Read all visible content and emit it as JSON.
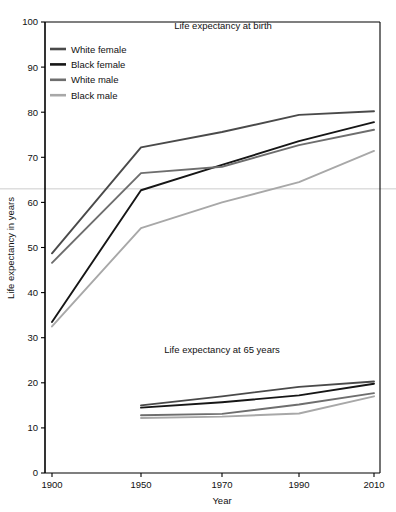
{
  "figure": {
    "background": "#ffffff",
    "frame_color": "#000000"
  },
  "axes": {
    "xlabel": "Year",
    "ylabel": "Life expectancy in years",
    "x_ticks": [
      "1900",
      "1950",
      "1970",
      "1990",
      "2010"
    ],
    "y_ticks": [
      "0",
      "10",
      "20",
      "30",
      "40",
      "50",
      "60",
      "70",
      "80",
      "90",
      "100"
    ],
    "xlim": [
      1900,
      2010
    ],
    "ylim": [
      0,
      100
    ],
    "grid": false,
    "reference_line_value": 63,
    "reference_line_color": "#cccccc"
  },
  "panel_titles": {
    "upper": "Life expectancy at birth",
    "lower": "Life expectancy at 65 years"
  },
  "legend": {
    "position": "top-left",
    "entries": [
      {
        "label": "White female",
        "color": "#4a4a4a"
      },
      {
        "label": "Black female",
        "color": "#161616"
      },
      {
        "label": "White male",
        "color": "#6e6e6e"
      },
      {
        "label": "Black male",
        "color": "#a8a8a8"
      }
    ]
  },
  "chart_data": {
    "type": "line",
    "title": "Life expectancy at birth",
    "subtitle": "Life expectancy at 65 years",
    "xlabel": "Year",
    "ylabel": "Life expectancy in years",
    "xlim": [
      1900,
      2010
    ],
    "ylim": [
      0,
      100
    ],
    "grid": false,
    "legend_position": "top-left",
    "x": [
      1900,
      1950,
      1970,
      1990,
      2010
    ],
    "panels": [
      {
        "name": "Life expectancy at birth",
        "x": [
          1900,
          1950,
          1970,
          1990,
          2010
        ],
        "series": [
          {
            "name": "White female",
            "color": "#4a4a4a",
            "values": [
              48.7,
              72.2,
              75.6,
              79.4,
              80.2
            ]
          },
          {
            "name": "Black female",
            "color": "#161616",
            "values": [
              33.5,
              62.7,
              68.3,
              73.6,
              77.8
            ]
          },
          {
            "name": "White male",
            "color": "#6e6e6e",
            "values": [
              46.6,
              66.5,
              67.9,
              72.7,
              76.1
            ]
          },
          {
            "name": "Black male",
            "color": "#a8a8a8",
            "values": [
              32.5,
              54.3,
              60.0,
              64.5,
              71.4
            ]
          }
        ]
      },
      {
        "name": "Life expectancy at 65 years",
        "x": [
          1950,
          1970,
          1990,
          2010
        ],
        "series": [
          {
            "name": "White female",
            "color": "#4a4a4a",
            "values": [
              15.0,
              17.0,
              19.1,
              20.3
            ]
          },
          {
            "name": "Black female",
            "color": "#161616",
            "values": [
              14.5,
              15.7,
              17.2,
              19.8
            ]
          },
          {
            "name": "White male",
            "color": "#6e6e6e",
            "values": [
              12.8,
              13.1,
              15.2,
              17.7
            ]
          },
          {
            "name": "Black male",
            "color": "#a8a8a8",
            "values": [
              12.2,
              12.5,
              13.2,
              17.0
            ]
          }
        ]
      }
    ]
  }
}
